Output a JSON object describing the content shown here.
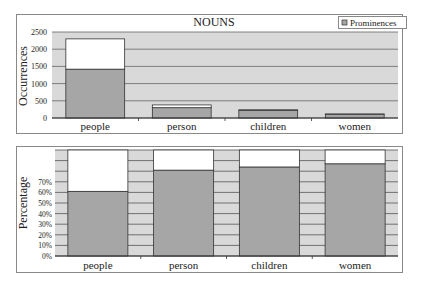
{
  "chart_data": [
    {
      "type": "bar",
      "stacked": true,
      "title": "NOUNS",
      "xlabel": "",
      "ylabel": "Occurrences",
      "ylim": [
        0,
        2500
      ],
      "yticks": [
        "0",
        "500",
        "1000",
        "1500",
        "2000",
        "2500"
      ],
      "categories": [
        "people",
        "person",
        "children",
        "women"
      ],
      "series": [
        {
          "name": "Prominences",
          "values": [
            1420,
            300,
            220,
            100
          ],
          "color": "#a6a6a6"
        },
        {
          "name": "Remainder",
          "values": [
            880,
            80,
            20,
            20
          ],
          "color": "#ffffff"
        }
      ],
      "legend": {
        "label": "Prominences",
        "placement": "top-right"
      },
      "grid": true,
      "background_color": "#d9d9d9"
    },
    {
      "type": "bar",
      "stacked": true,
      "title": "",
      "xlabel": "",
      "ylabel": "Percentage",
      "ylim": [
        0,
        100
      ],
      "yticks": [
        "0%",
        "10%",
        "20%",
        "30%",
        "40%",
        "50%",
        "60%",
        "70%"
      ],
      "categories": [
        "people",
        "person",
        "children",
        "women"
      ],
      "series": [
        {
          "name": "Prominences",
          "values": [
            61,
            81,
            84,
            87
          ],
          "color": "#a6a6a6"
        },
        {
          "name": "Remainder",
          "values": [
            39,
            19,
            16,
            13
          ],
          "color": "#ffffff"
        }
      ],
      "grid": true,
      "background_color": "#d9d9d9"
    }
  ]
}
